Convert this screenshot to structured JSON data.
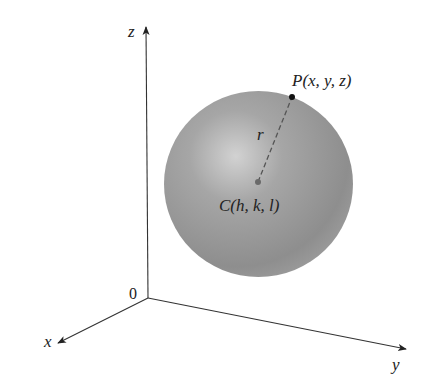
{
  "figure": {
    "axes": {
      "x_label": "x",
      "y_label": "y",
      "z_label": "z",
      "origin_label": "0"
    },
    "sphere": {
      "center_label": "C(h, k, l)",
      "point_label": "P(x, y, z)",
      "radius_label": "r",
      "fill_color": "#8f8f8f",
      "highlight_color": "#d0d0d0"
    },
    "colors": {
      "axis": "#333333",
      "point": "#111111",
      "center_dot": "#6a6a6a"
    }
  }
}
